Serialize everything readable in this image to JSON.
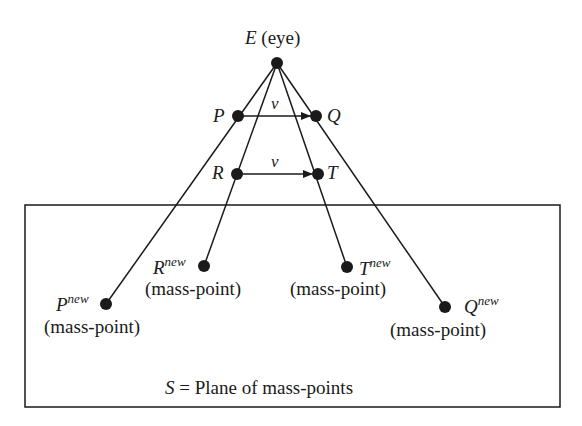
{
  "diagram": {
    "colors": {
      "stroke": "#1a1a1a",
      "background": "#ffffff"
    },
    "eye": {
      "symbol": "E",
      "label": "(eye)",
      "x": 277,
      "y": 63
    },
    "points": {
      "P": {
        "symbol": "P",
        "x": 238,
        "y": 116
      },
      "Q": {
        "symbol": "Q",
        "x": 316,
        "y": 116
      },
      "R": {
        "symbol": "R",
        "x": 237,
        "y": 174
      },
      "T": {
        "symbol": "T",
        "x": 318,
        "y": 174
      }
    },
    "vectors": [
      {
        "from": "P",
        "to": "Q",
        "label": "ν"
      },
      {
        "from": "R",
        "to": "T",
        "label": "ν"
      }
    ],
    "mass_points": {
      "Pnew": {
        "symbol": "P",
        "sup": "new",
        "caption": "(mass-point)",
        "x": 106,
        "y": 304
      },
      "Rnew": {
        "symbol": "R",
        "sup": "new",
        "caption": "(mass-point)",
        "x": 204,
        "y": 266
      },
      "Tnew": {
        "symbol": "T",
        "sup": "new",
        "caption": "(mass-point)",
        "x": 347,
        "y": 267
      },
      "Qnew": {
        "symbol": "Q",
        "sup": "new",
        "caption": "(mass-point)",
        "x": 445,
        "y": 307
      }
    },
    "plane": {
      "symbol": "S",
      "eq": "=",
      "label": "Plane of mass-points",
      "x": 25,
      "y": 205,
      "width": 535,
      "height": 202
    }
  }
}
